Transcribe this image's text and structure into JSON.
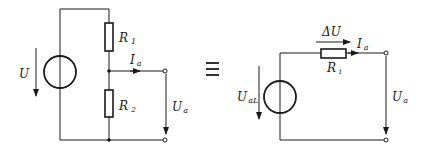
{
  "left_circuit": {
    "source_voltage": "U",
    "resistor_1": {
      "symbol": "R",
      "sub": "1"
    },
    "resistor_2": {
      "symbol": "R",
      "sub": "2"
    },
    "output_current": {
      "symbol": "I",
      "sub": "a"
    },
    "output_voltage": {
      "symbol": "U",
      "sub": "a"
    }
  },
  "equivalence_symbol": "≡",
  "right_circuit": {
    "source_voltage": {
      "symbol": "U",
      "sub": "aL"
    },
    "internal_resistor": {
      "symbol": "R",
      "sub": "i"
    },
    "voltage_drop": "ΔU",
    "output_current": {
      "symbol": "I",
      "sub": "a"
    },
    "output_voltage": {
      "symbol": "U",
      "sub": "a"
    }
  },
  "colors": {
    "line": "#1a1a1a",
    "background": "#ffffff"
  }
}
